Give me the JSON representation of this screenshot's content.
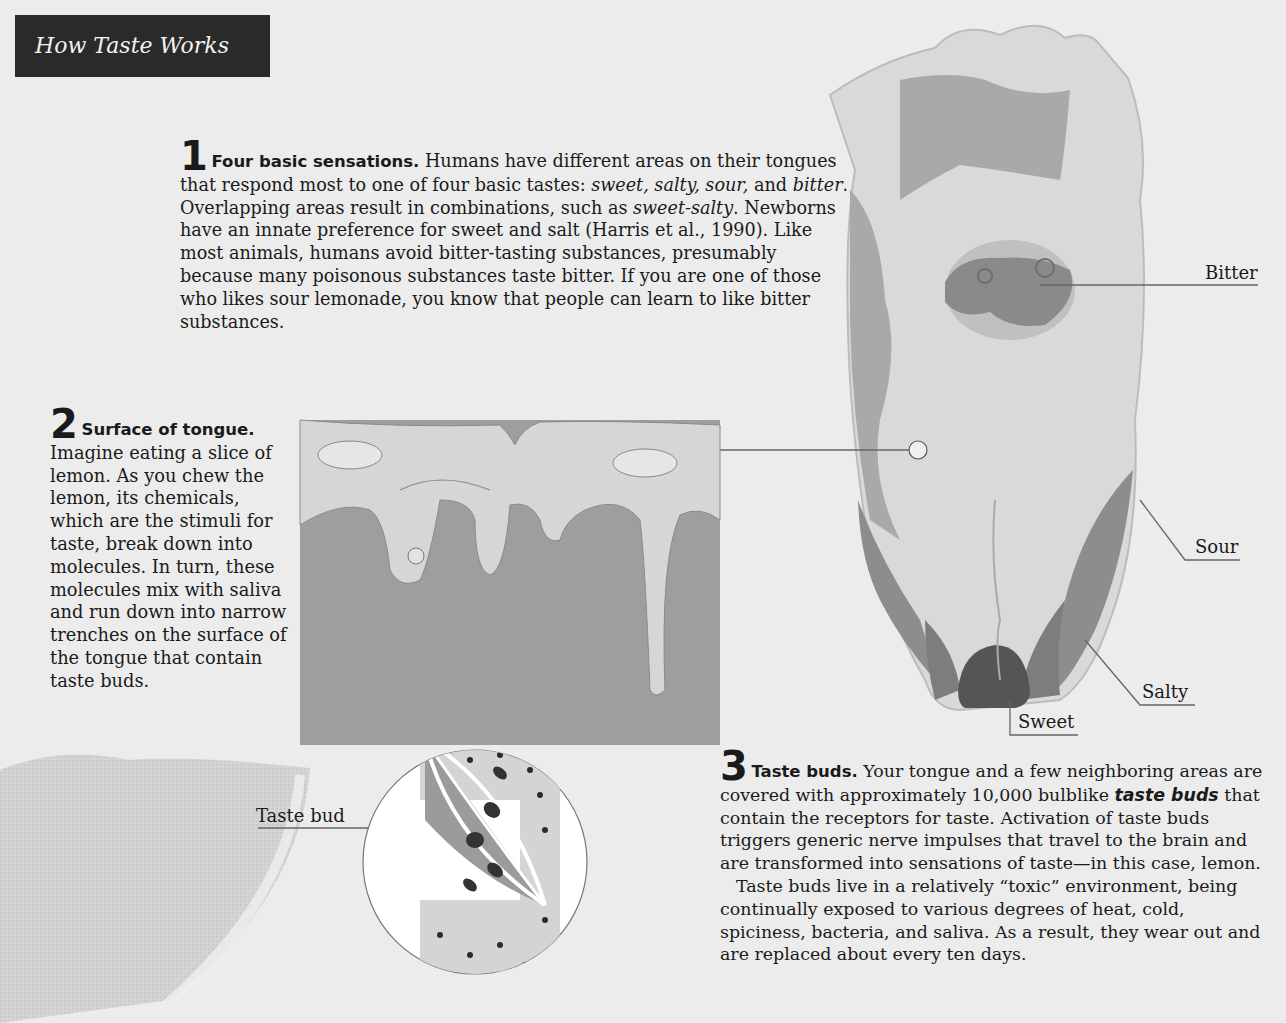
{
  "header": {
    "title": "How Taste Works"
  },
  "sections": [
    {
      "number": "1",
      "heading": "Four basic sensations.",
      "body_parts": [
        " Humans have different areas on their tongues that respond most to one of four basic tastes: ",
        "sweet, salty, sour,",
        " and ",
        "bitter",
        ". Overlapping areas result in combinations, such as ",
        "sweet-salty",
        ". Newborns have an innate preference for sweet and salt (Harris et al., 1990). Like most animals, humans avoid bitter-tasting substances, presumably because many poisonous substances taste bitter. If you are one of those who likes sour lemonade, you know that people can learn to like bitter substances."
      ]
    },
    {
      "number": "2",
      "heading": "Surface of tongue.",
      "body": "Imagine eating a slice of lemon. As you chew the lemon, its chemicals, which are the stimuli for taste, break down into molecules. In turn, these molecules mix with saliva and run down into narrow trenches on the surface of the tongue that contain taste buds."
    },
    {
      "number": "3",
      "heading": "Taste buds.",
      "body_parts": [
        " Your tongue and a few neighboring areas are covered with approximately 10,000 bulblike ",
        "taste buds",
        " that contain the receptors for taste. Activation of taste buds triggers generic nerve impulses that travel to the brain and are transformed into sensations of taste—in this case, lemon."
      ],
      "paragraph2": "Taste buds live in a relatively “toxic” environment, being continually exposed to various degrees of heat, cold, spiciness, bacteria, and saliva. As a result, they wear out and are replaced about every ten days."
    }
  ],
  "labels": {
    "bitter": "Bitter",
    "sour": "Sour",
    "salty": "Salty",
    "sweet": "Sweet",
    "taste_bud": "Taste bud"
  },
  "colors": {
    "background": "#ececec",
    "title_bar": "#2a2a2a",
    "tongue_light": "#d9d9d9",
    "tongue_mid": "#a8a8a8",
    "tongue_dark": "#7a7a7a",
    "tissue": "#9e9e9e",
    "mucosa": "#d6d6d6"
  }
}
